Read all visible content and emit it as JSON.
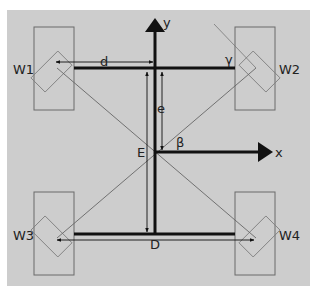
{
  "diagram": {
    "background_color": "#cdcdcd",
    "line_color": "#111111",
    "thin_line_color": "#555555",
    "wheel_outline_color": "#6a6a6a",
    "wheels": [
      {
        "id": "W1",
        "label": "W1"
      },
      {
        "id": "W2",
        "label": "W2"
      },
      {
        "id": "W3",
        "label": "W3"
      },
      {
        "id": "W4",
        "label": "W4"
      }
    ],
    "axes": {
      "x_label": "x",
      "y_label": "y"
    },
    "dimensions": {
      "d": "d",
      "e": "e",
      "E": "E",
      "D": "D"
    },
    "angles": {
      "beta": "β",
      "gamma": "γ"
    }
  }
}
